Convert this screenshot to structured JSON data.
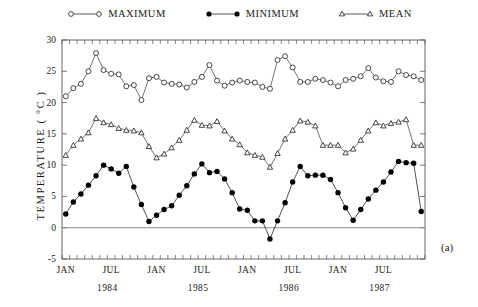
{
  "panel_label": "(a)",
  "legend": {
    "position": "top-center",
    "items": [
      {
        "label": "MAXIMUM",
        "marker": "open-circle-marker",
        "color": "#333333"
      },
      {
        "label": "MINIMUM",
        "marker": "filled-circle-marker",
        "color": "#000000"
      },
      {
        "label": "MEAN",
        "marker": "open-triangle-marker",
        "color": "#333333"
      }
    ]
  },
  "chart_data": {
    "type": "line",
    "title": "",
    "subtitle": "",
    "xlabel": "",
    "ylabel": "TEMPERATURE ( °C )",
    "ylabel_plain": "TEMPERATURE (degC)",
    "ylim": [
      -5,
      30
    ],
    "yticks": [
      -5,
      0,
      5,
      10,
      15,
      20,
      25,
      30
    ],
    "grid": false,
    "axis_frame": "box-with-inward-monthly-ticks",
    "legend_position": "top-center",
    "x_tick_labels": [
      "JAN",
      "JUL",
      "JAN",
      "JUL",
      "JAN",
      "JUL",
      "JAN",
      "JUL"
    ],
    "x_group_labels": [
      "1984",
      "1985",
      "1986",
      "1987"
    ],
    "x_unit": "month",
    "x_range": [
      "1984-01",
      "1987-12"
    ],
    "n_points": 48,
    "x": [
      "1984-01",
      "1984-02",
      "1984-03",
      "1984-04",
      "1984-05",
      "1984-06",
      "1984-07",
      "1984-08",
      "1984-09",
      "1984-10",
      "1984-11",
      "1984-12",
      "1985-01",
      "1985-02",
      "1985-03",
      "1985-04",
      "1985-05",
      "1985-06",
      "1985-07",
      "1985-08",
      "1985-09",
      "1985-10",
      "1985-11",
      "1985-12",
      "1986-01",
      "1986-02",
      "1986-03",
      "1986-04",
      "1986-05",
      "1986-06",
      "1986-07",
      "1986-08",
      "1986-09",
      "1986-10",
      "1986-11",
      "1986-12",
      "1987-01",
      "1987-02",
      "1987-03",
      "1987-04",
      "1987-05",
      "1987-06",
      "1987-07",
      "1987-08",
      "1987-09",
      "1987-10",
      "1987-11",
      "1987-12"
    ],
    "series": [
      {
        "name": "MAXIMUM",
        "marker": "open-circle",
        "color": "#333333",
        "values": [
          21.0,
          22.3,
          23.0,
          25.0,
          27.9,
          25.2,
          24.6,
          24.5,
          22.6,
          22.8,
          20.4,
          23.9,
          24.1,
          23.2,
          23.0,
          22.9,
          22.4,
          23.3,
          24.1,
          26.0,
          23.5,
          22.7,
          23.2,
          23.5,
          23.3,
          23.2,
          22.5,
          22.2,
          26.8,
          27.4,
          25.6,
          23.3,
          23.3,
          23.8,
          23.6,
          23.2,
          22.6,
          23.6,
          23.8,
          24.2,
          25.5,
          24.0,
          23.4,
          23.3,
          25.0,
          24.4,
          24.2,
          23.6
        ]
      },
      {
        "name": "MINIMUM",
        "marker": "filled-circle",
        "color": "#000000",
        "values": [
          2.2,
          4.1,
          5.4,
          6.8,
          8.3,
          10.0,
          9.4,
          8.7,
          9.8,
          6.5,
          3.7,
          1.0,
          2.0,
          2.9,
          3.5,
          5.2,
          6.7,
          8.6,
          10.2,
          8.8,
          9.0,
          7.8,
          5.6,
          3.0,
          2.8,
          1.1,
          1.1,
          -1.8,
          1.1,
          4.0,
          7.3,
          9.8,
          8.3,
          8.4,
          8.4,
          7.7,
          5.6,
          3.2,
          1.2,
          2.9,
          4.6,
          6.0,
          7.3,
          8.9,
          10.6,
          10.4,
          10.3,
          2.6
        ]
      },
      {
        "name": "MEAN",
        "marker": "open-triangle",
        "color": "#333333",
        "values": [
          11.6,
          13.2,
          14.2,
          15.2,
          17.5,
          16.8,
          16.5,
          15.9,
          15.6,
          15.5,
          15.2,
          13.0,
          11.2,
          11.8,
          12.8,
          14.0,
          15.6,
          17.2,
          16.4,
          16.3,
          17.0,
          15.5,
          14.2,
          13.3,
          12.0,
          11.6,
          11.3,
          9.7,
          11.9,
          14.2,
          15.6,
          17.1,
          16.9,
          16.3,
          13.2,
          13.2,
          13.2,
          12.0,
          12.6,
          14.0,
          15.5,
          16.8,
          16.3,
          16.7,
          16.9,
          17.3,
          13.2,
          13.2
        ]
      }
    ]
  }
}
